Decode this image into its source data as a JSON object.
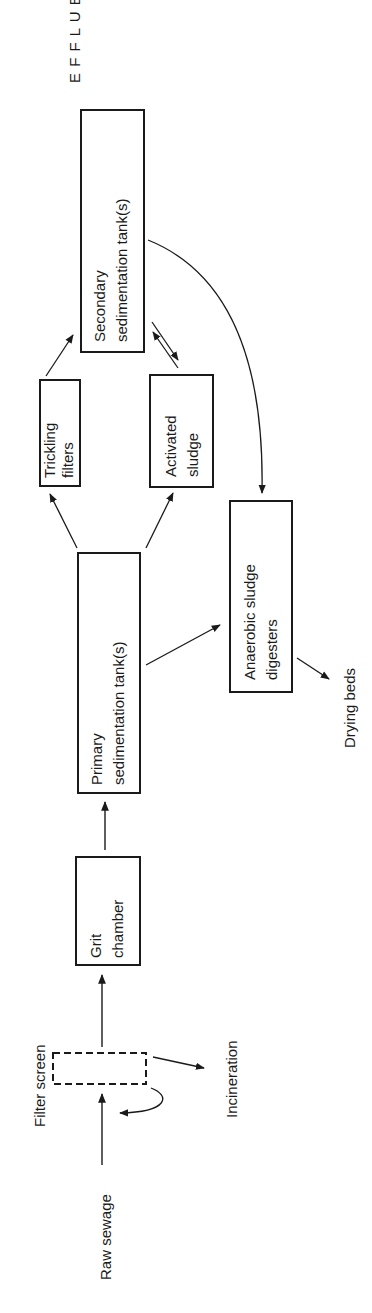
{
  "diagram": {
    "type": "flowchart",
    "orientation": "rotated-90-ccw",
    "nodes": {
      "raw_sewage": {
        "label": "Raw sewage"
      },
      "filter_screen": {
        "label": "Filter screen",
        "style": "dashed"
      },
      "incineration": {
        "label": "Incineration"
      },
      "grit_chamber": {
        "line1": "Grit",
        "line2": "chamber"
      },
      "primary": {
        "line1": "Primary",
        "line2": "sedimentation tank(s)"
      },
      "trickling": {
        "line1": "Trickling",
        "line2": "filters"
      },
      "activated": {
        "line1": "Activated",
        "line2": "sludge"
      },
      "secondary": {
        "line1": "Secondary",
        "line2": "sedimentation tank(s)"
      },
      "anaerobic": {
        "line1": "Anaerobic sludge",
        "line2": "digesters"
      },
      "drying_beds": {
        "label": "Drying beds"
      },
      "effluent": {
        "letters": [
          "E",
          "F",
          "F",
          "L",
          "U",
          "E",
          "N",
          "T"
        ]
      }
    },
    "edges": [
      {
        "from": "Raw sewage",
        "to": "Filter screen"
      },
      {
        "from": "Filter screen",
        "to": "Incineration"
      },
      {
        "from": "Filter screen",
        "to": "Raw sewage",
        "style": "curved-return"
      },
      {
        "from": "Filter screen",
        "to": "Grit chamber"
      },
      {
        "from": "Grit chamber",
        "to": "Primary sedimentation tank(s)"
      },
      {
        "from": "Primary sedimentation tank(s)",
        "to": "Trickling filters"
      },
      {
        "from": "Primary sedimentation tank(s)",
        "to": "Activated sludge"
      },
      {
        "from": "Primary sedimentation tank(s)",
        "to": "Anaerobic sludge digesters"
      },
      {
        "from": "Trickling filters",
        "to": "Secondary sedimentation tank(s)"
      },
      {
        "from": "Activated sludge",
        "to": "Secondary sedimentation tank(s)",
        "style": "bidirectional"
      },
      {
        "from": "Secondary sedimentation tank(s)",
        "to": "Anaerobic sludge digesters",
        "style": "curved"
      },
      {
        "from": "Anaerobic sludge digesters",
        "to": "Drying beds"
      },
      {
        "from": "Secondary sedimentation tank(s)",
        "to": "EFFLUENT"
      }
    ]
  }
}
